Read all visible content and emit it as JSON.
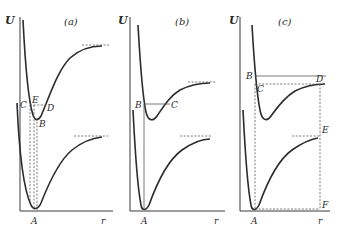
{
  "panels": [
    {
      "id": "a",
      "title": "(a)",
      "y_axis_label": "U",
      "x_axis_label": "r",
      "points": {
        "A": "A",
        "B": "B",
        "C": "C",
        "D": "D",
        "E": "E"
      }
    },
    {
      "id": "b",
      "title": "(b)",
      "y_axis_label": "U",
      "x_axis_label": "r",
      "points": {
        "A": "A",
        "B": "B",
        "C": "C"
      }
    },
    {
      "id": "c",
      "title": "(c)",
      "y_axis_label": "U",
      "x_axis_label": "r",
      "points": {
        "A": "A",
        "B": "B",
        "C": "C",
        "D": "D",
        "E": "E",
        "F": "F"
      }
    }
  ],
  "colors": {
    "line": "#2b2b2b",
    "background": "#ffffff"
  }
}
